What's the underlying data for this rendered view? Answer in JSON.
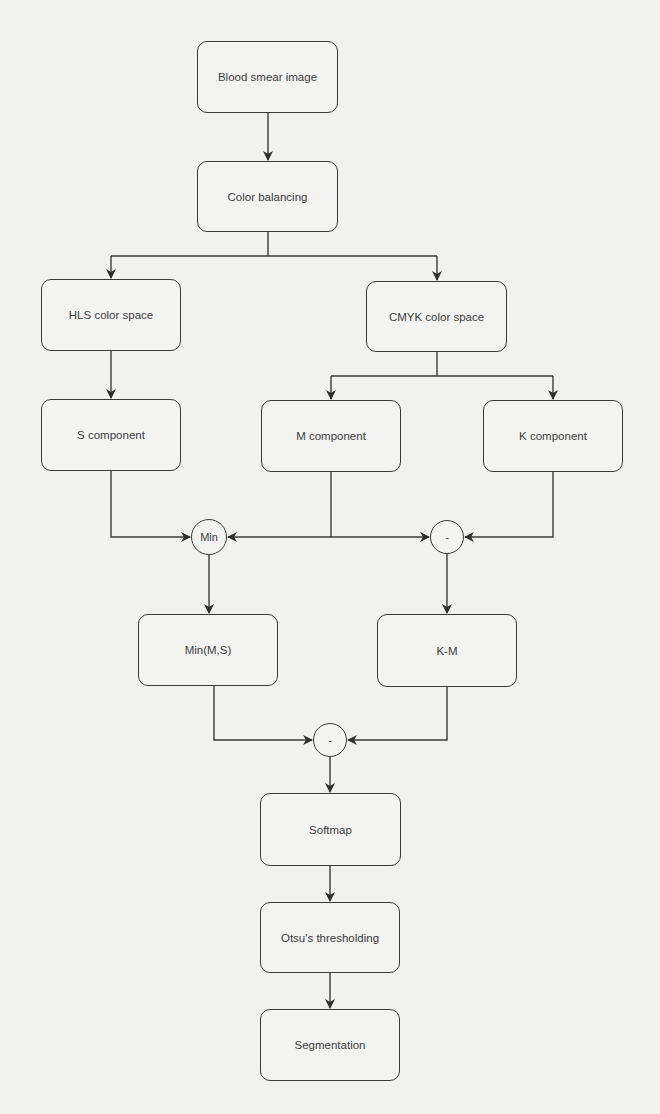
{
  "diagram": {
    "type": "flowchart",
    "title": "",
    "nodes": [
      {
        "id": "blood",
        "label": "Blood smear image",
        "shape": "rounded-rect"
      },
      {
        "id": "color",
        "label": "Color balancing",
        "shape": "rounded-rect"
      },
      {
        "id": "hls",
        "label": "HLS color space",
        "shape": "rounded-rect"
      },
      {
        "id": "cmyk",
        "label": "CMYK color space",
        "shape": "rounded-rect"
      },
      {
        "id": "s",
        "label": "S component",
        "shape": "rounded-rect"
      },
      {
        "id": "m",
        "label": "M component",
        "shape": "rounded-rect"
      },
      {
        "id": "k",
        "label": "K component",
        "shape": "rounded-rect"
      },
      {
        "id": "min_op",
        "label": "Min",
        "shape": "circle"
      },
      {
        "id": "sub_op1",
        "label": "-",
        "shape": "circle"
      },
      {
        "id": "minms",
        "label": "Min(M,S)",
        "shape": "rounded-rect"
      },
      {
        "id": "km",
        "label": "K-M",
        "shape": "rounded-rect"
      },
      {
        "id": "sub_op2",
        "label": "-",
        "shape": "circle"
      },
      {
        "id": "softmap",
        "label": "Softmap",
        "shape": "rounded-rect"
      },
      {
        "id": "otsu",
        "label": "Otsu's thresholding",
        "shape": "rounded-rect"
      },
      {
        "id": "seg",
        "label": "Segmentation",
        "shape": "rounded-rect"
      }
    ],
    "edges": [
      [
        "blood",
        "color"
      ],
      [
        "color",
        "hls"
      ],
      [
        "color",
        "cmyk"
      ],
      [
        "hls",
        "s"
      ],
      [
        "cmyk",
        "m"
      ],
      [
        "cmyk",
        "k"
      ],
      [
        "s",
        "min_op"
      ],
      [
        "m",
        "min_op"
      ],
      [
        "m",
        "sub_op1"
      ],
      [
        "k",
        "sub_op1"
      ],
      [
        "min_op",
        "minms"
      ],
      [
        "sub_op1",
        "km"
      ],
      [
        "minms",
        "sub_op2"
      ],
      [
        "km",
        "sub_op2"
      ],
      [
        "sub_op2",
        "softmap"
      ],
      [
        "softmap",
        "otsu"
      ],
      [
        "otsu",
        "seg"
      ]
    ]
  },
  "labels": {
    "blood": "Blood smear image",
    "color": "Color balancing",
    "hls": "HLS color space",
    "cmyk": "CMYK color space",
    "s": "S component",
    "m": "M component",
    "k": "K component",
    "min_op": "Min",
    "sub_op1": "-",
    "minms": "Min(M,S)",
    "km": "K-M",
    "sub_op2": "-",
    "softmap": "Softmap",
    "otsu": "Otsu's thresholding",
    "seg": "Segmentation"
  },
  "colors": {
    "background": "#f1f1ef",
    "stroke": "#3a3a3a",
    "text": "#3d3d3d"
  }
}
